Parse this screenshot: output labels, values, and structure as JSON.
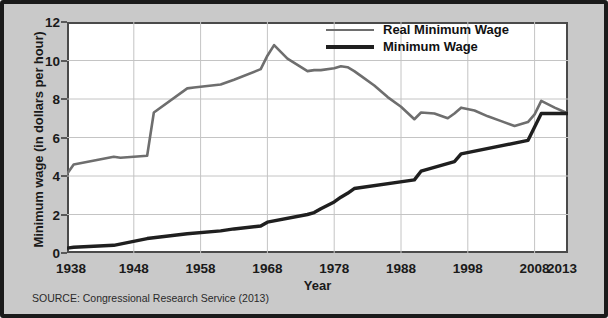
{
  "chart_data": {
    "type": "line",
    "title": "",
    "xlabel": "Year",
    "ylabel": "Minimum wage (in dollars per hour)",
    "xlim": [
      1938,
      2013
    ],
    "ylim": [
      0,
      12
    ],
    "xticks": [
      "1938",
      "1948",
      "1958",
      "1968",
      "1978",
      "1988",
      "1998",
      "2008",
      "2013"
    ],
    "xtick_values": [
      1938,
      1948,
      1958,
      1968,
      1978,
      1988,
      1998,
      2008,
      2013
    ],
    "yticks": [
      "0",
      "2",
      "4",
      "6",
      "8",
      "10",
      "12"
    ],
    "ytick_values": [
      0,
      2,
      4,
      6,
      8,
      10,
      12
    ],
    "grid": true,
    "legend_position": "top-right",
    "series": [
      {
        "name": "Real Minimum Wage",
        "color": "#6e6e6e",
        "x": [
          1938,
          1939,
          1945,
          1946,
          1950,
          1951,
          1956,
          1957,
          1961,
          1963,
          1967,
          1968,
          1969,
          1971,
          1974,
          1975,
          1976,
          1978,
          1979,
          1980,
          1981,
          1982,
          1984,
          1986,
          1988,
          1990,
          1991,
          1993,
          1995,
          1996,
          1997,
          1999,
          2001,
          2003,
          2005,
          2007,
          2008,
          2009,
          2011,
          2013
        ],
        "y": [
          4.1,
          4.6,
          5.0,
          4.95,
          5.05,
          7.3,
          8.55,
          8.6,
          8.75,
          9.0,
          9.55,
          10.25,
          10.8,
          10.1,
          9.45,
          9.5,
          9.5,
          9.6,
          9.7,
          9.65,
          9.45,
          9.2,
          8.7,
          8.1,
          7.6,
          6.95,
          7.3,
          7.25,
          7.0,
          7.25,
          7.55,
          7.4,
          7.1,
          6.85,
          6.6,
          6.8,
          7.2,
          7.9,
          7.55,
          7.25
        ]
      },
      {
        "name": "Minimum Wage",
        "color": "#1f1f1f",
        "x": [
          1938,
          1939,
          1945,
          1950,
          1956,
          1961,
          1963,
          1967,
          1968,
          1974,
          1975,
          1976,
          1978,
          1979,
          1980,
          1981,
          1990,
          1991,
          1996,
          1997,
          2007,
          2008,
          2009,
          2013
        ],
        "y": [
          0.25,
          0.3,
          0.4,
          0.75,
          1.0,
          1.15,
          1.25,
          1.4,
          1.6,
          2.0,
          2.1,
          2.3,
          2.65,
          2.9,
          3.1,
          3.35,
          3.8,
          4.25,
          4.75,
          5.15,
          5.85,
          6.55,
          7.25,
          7.25
        ]
      }
    ],
    "legend": [
      {
        "label": "Real Minimum Wage",
        "color": "#6e6e6e",
        "width": 2.6
      },
      {
        "label": "Minimum Wage",
        "color": "#1f1f1f",
        "width": 4.0
      }
    ]
  },
  "source_note": "SOURCE: Congressional Research Service (2013)"
}
